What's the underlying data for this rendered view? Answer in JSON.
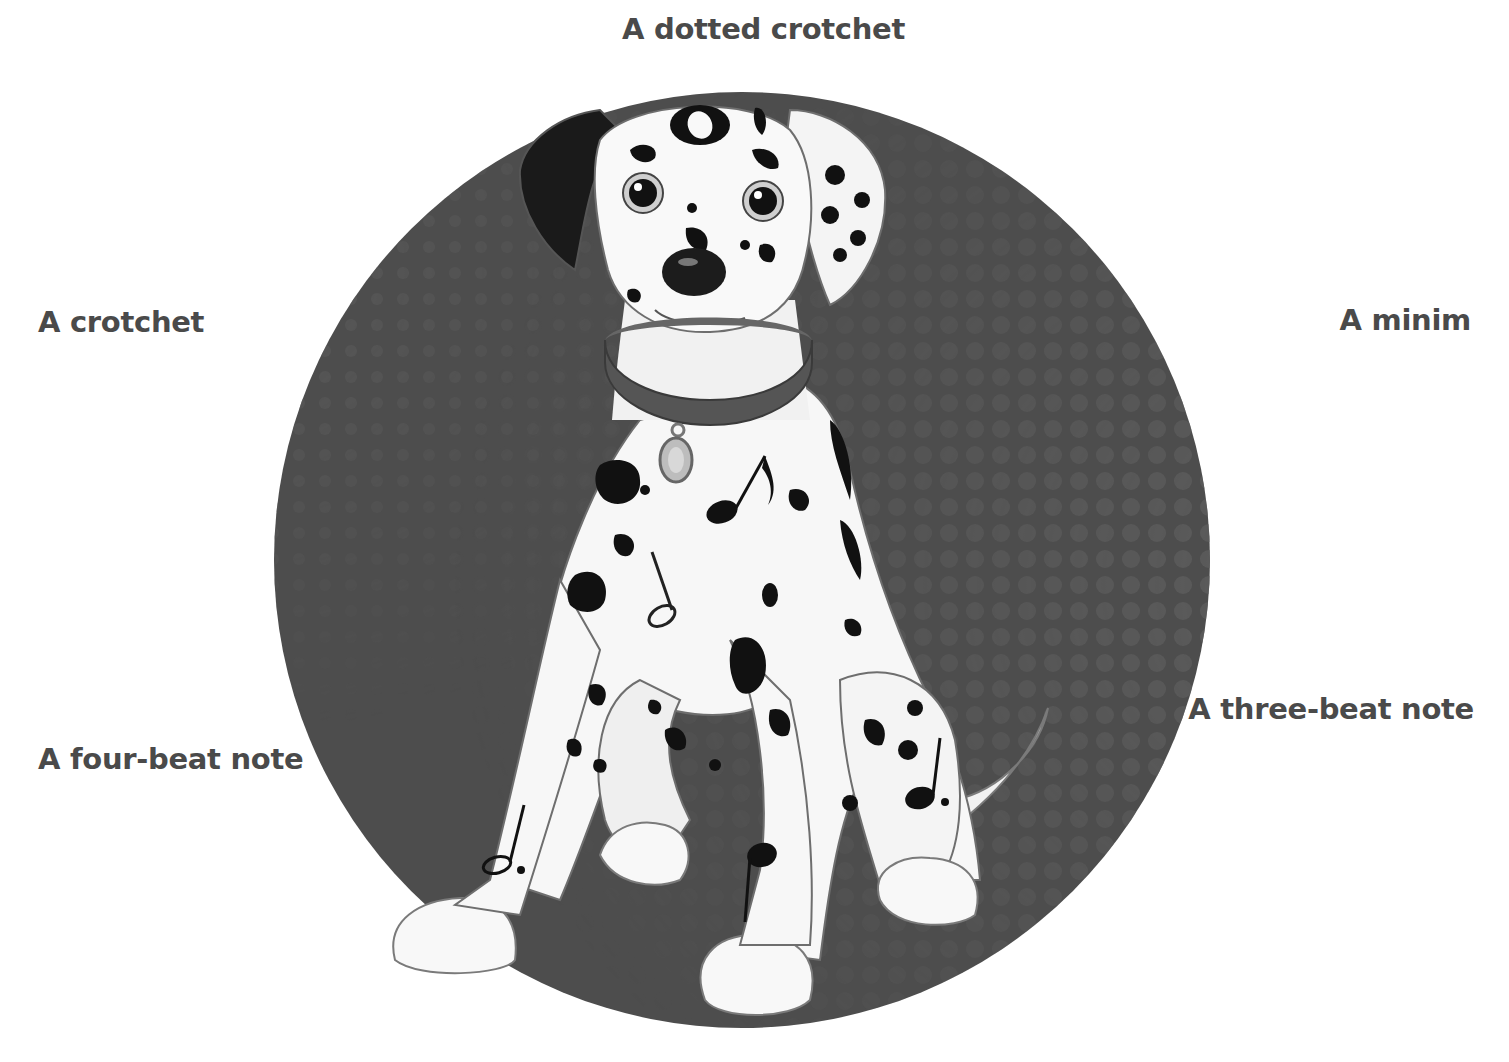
{
  "labels": {
    "top": "A dotted crotchet",
    "left_upper": "A crotchet",
    "right_upper": "A minim",
    "right_lower": "A three-beat note",
    "left_lower": "A four-beat note"
  },
  "illustration": {
    "subject": "Dalmatian puppy sitting",
    "background": "dark circle with halftone dots",
    "hidden_notes": [
      {
        "name": "semibreve",
        "location": "forehead"
      },
      {
        "name": "quaver",
        "location": "chest"
      },
      {
        "name": "minim",
        "location": "chest/left leg"
      },
      {
        "name": "dotted-crotchet",
        "location": "right haunch"
      },
      {
        "name": "dotted-minim",
        "location": "front-left leg"
      },
      {
        "name": "crotchet",
        "location": "front-right leg"
      }
    ]
  },
  "colors": {
    "text": "#4a4a4a",
    "circle": "#4d4d4d",
    "dots": "#5e5e5e",
    "fur": "#f7f7f7",
    "spots": "#111111",
    "outline": "#6e6e6e"
  }
}
